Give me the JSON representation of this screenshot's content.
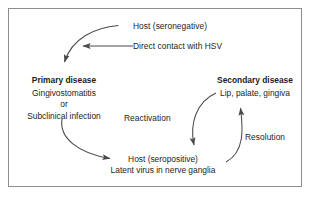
{
  "diagram": {
    "title_text": "Herpes simplex virus infection cycle",
    "border_color": "#8e8e8e",
    "background_color": "#ffffff",
    "stroke_color": "#4a4a4a",
    "text_color": "#1c1c1c",
    "nodes": {
      "host_seronegative": {
        "label": "Host (seronegative)"
      },
      "direct_contact": {
        "label": "Direct contact with HSV"
      },
      "primary_disease": {
        "heading": "Primary disease",
        "line1": "Gingivostomatitis",
        "line2": "or",
        "line3": "Subclinical infection"
      },
      "secondary_disease": {
        "heading": "Secondary disease",
        "line1": "Lip, palate, gingiva"
      },
      "host_seropositive": {
        "line1": "Host (seropositive)",
        "line2": "Latent virus in nerve ganglia"
      }
    },
    "edges": {
      "reactivation": {
        "label": "Reactivation"
      },
      "resolution": {
        "label": "Resolution"
      }
    }
  }
}
